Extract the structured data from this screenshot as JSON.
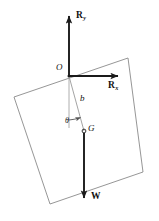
{
  "figure": {
    "background_color": "#ffffff",
    "ink_color": "#1a1a1a",
    "thin_line_color": "#8a8a8a"
  },
  "labels": {
    "reaction_vertical": "R",
    "reaction_vertical_sub": "y",
    "reaction_horizontal": "R",
    "reaction_horizontal_sub": "x",
    "origin": "O",
    "distance": "b",
    "angle": "θ",
    "center_of_gravity": "G",
    "weight": "W"
  },
  "geometry": {
    "block_corners": [
      [
        14,
        97
      ],
      [
        128,
        58
      ],
      [
        143,
        172
      ],
      [
        50,
        204
      ]
    ],
    "origin_point": [
      69,
      76
    ],
    "cg_point": [
      84,
      131
    ],
    "ry_arrow": {
      "from": [
        69,
        76
      ],
      "to": [
        69,
        16
      ]
    },
    "rx_arrow": {
      "from": [
        69,
        76
      ],
      "to": [
        118,
        76
      ]
    },
    "w_arrow": {
      "from": [
        84,
        131
      ],
      "to": [
        84,
        198
      ]
    },
    "b_line": {
      "from": [
        69,
        76
      ],
      "to": [
        84,
        131
      ]
    },
    "vertical_reference": {
      "from": [
        69,
        76
      ],
      "to": [
        69,
        128
      ]
    },
    "angle_arc_center": [
      69,
      76
    ],
    "angle_arc_radius": 44
  }
}
